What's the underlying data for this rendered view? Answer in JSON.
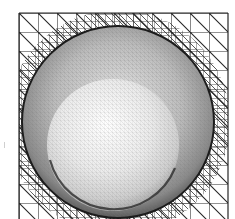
{
  "image": {
    "subject": "3D rendered mesh: sphere resting inside a spherical bowl cut into a triangulated plane",
    "width": 235,
    "height": 219,
    "background": "#ffffff"
  },
  "grid": {
    "x0": 19,
    "y0": 13,
    "x1": 228,
    "y1": 219,
    "coarse_cell": 19,
    "line_color": "#2a2a2a",
    "fine_line_color": "#333333"
  },
  "bowl": {
    "cx": 118,
    "cy": 122,
    "r": 96,
    "rim_color": "#1c1c1c",
    "shade_light": "#e6e6e6",
    "shade_mid": "#a8a8a8",
    "shade_dark": "#5a5a5a"
  },
  "sphere": {
    "cx": 113,
    "cy": 145,
    "r": 66,
    "highlight": "#fbfbfb",
    "mid": "#d9d9d9",
    "edge": "#8c8c8c"
  }
}
